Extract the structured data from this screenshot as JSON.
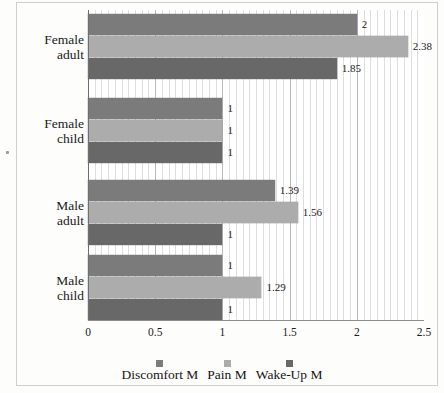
{
  "chart_data": {
    "type": "bar",
    "orientation": "horizontal",
    "title": "",
    "xlabel": "",
    "ylabel": "",
    "xlim": [
      0,
      2.5
    ],
    "xticks": [
      "0",
      "0.5",
      "1",
      "1.5",
      "2",
      "2.5"
    ],
    "xtick_values": [
      0,
      0.5,
      1,
      1.5,
      2,
      2.5
    ],
    "grid": true,
    "grid_axis": "x",
    "minor_grid_step": 0.05,
    "legend_position": "bottom",
    "categories": [
      "Female adult",
      "Female child",
      "Male adult",
      "Male child"
    ],
    "category_lines": [
      [
        "Female",
        "adult"
      ],
      [
        "Female",
        "child"
      ],
      [
        "Male",
        "adult"
      ],
      [
        "Male",
        "child"
      ]
    ],
    "series": [
      {
        "name": "Discomfort M",
        "color": "#7b7b7b",
        "values": [
          2,
          1,
          1.39,
          1
        ],
        "labels": [
          "2",
          "1",
          "1.39",
          "1"
        ]
      },
      {
        "name": "Pain M",
        "color": "#acacac",
        "values": [
          2.38,
          1,
          1.56,
          1.29
        ],
        "labels": [
          "2.38",
          "1",
          "1.56",
          "1.29"
        ]
      },
      {
        "name": "Wake-Up M",
        "color": "#686868",
        "values": [
          1.85,
          1,
          1,
          1
        ],
        "labels": [
          "1.85",
          "1",
          "1",
          "1"
        ]
      }
    ]
  },
  "legend": {
    "items": [
      {
        "label": "Discomfort M",
        "color": "#7b7b7b"
      },
      {
        "label": "Pain M",
        "color": "#acacac"
      },
      {
        "label": "Wake-Up M",
        "color": "#686868"
      }
    ]
  },
  "colors": {
    "discomfort": "#7b7b7b",
    "pain": "#acacac",
    "wakeup": "#686868",
    "grid_minor": "#d8d8d8",
    "grid_major": "#b9b9b9",
    "axis": "#6f6f6f",
    "text": "#1a1a1a",
    "background": "#fdfdfc"
  }
}
